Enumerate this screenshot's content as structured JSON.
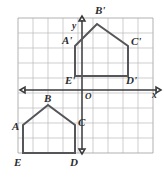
{
  "figure": {
    "axis": {
      "x_label": "x",
      "y_label": "y",
      "origin_label": "O"
    },
    "colors": {
      "grid": "#b9b9bc",
      "axis": "#3a3a3c",
      "shape_stroke": "#55555a",
      "background": "#ffffff",
      "label_text": "#2c2c2e"
    },
    "grid": {
      "cell_px": 15,
      "left_px": 18,
      "top_px": 18,
      "cols": 9,
      "rows": 9
    },
    "shapes": [
      {
        "name": "preimage",
        "id": "pentagon-abcde",
        "vertices": [
          {
            "label": "A",
            "x": 23,
            "y": 125,
            "label_x": 12,
            "label_y": 130
          },
          {
            "label": "B",
            "x": 48,
            "y": 105,
            "label_x": 44,
            "label_y": 102
          },
          {
            "label": "C",
            "x": 75,
            "y": 125,
            "label_x": 78,
            "label_y": 126
          },
          {
            "label": "D",
            "x": 75,
            "y": 153,
            "label_x": 70,
            "label_y": 166
          },
          {
            "label": "E",
            "x": 23,
            "y": 153,
            "label_x": 14,
            "label_y": 166
          }
        ]
      },
      {
        "name": "image",
        "id": "pentagon-abcde-prime",
        "vertices": [
          {
            "label": "A'",
            "x": 75,
            "y": 46,
            "label_x": 62,
            "label_y": 44
          },
          {
            "label": "B'",
            "x": 97,
            "y": 24,
            "label_x": 95,
            "label_y": 14
          },
          {
            "label": "C'",
            "x": 128,
            "y": 46,
            "label_x": 131,
            "label_y": 45
          },
          {
            "label": "D'",
            "x": 128,
            "y": 76,
            "label_x": 126,
            "label_y": 84
          },
          {
            "label": "E'",
            "x": 75,
            "y": 76,
            "label_x": 65,
            "label_y": 84
          }
        ]
      }
    ],
    "axes_geometry": {
      "x_axis_y": 90,
      "y_axis_x": 82,
      "x_axis_start": 24,
      "x_axis_end": 157,
      "y_axis_start": 20,
      "y_axis_end": 150,
      "x_label_pos": {
        "x": 152,
        "y": 98
      },
      "y_label_pos": {
        "x": 72,
        "y": 29
      },
      "origin_pos": {
        "x": 85,
        "y": 99
      }
    }
  }
}
